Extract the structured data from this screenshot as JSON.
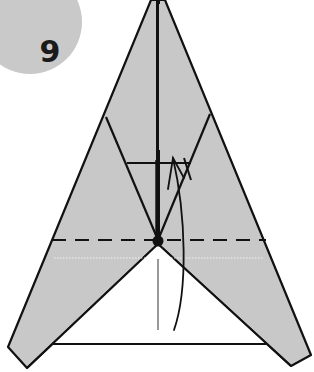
{
  "step": {
    "number": "9"
  },
  "colors": {
    "paper_fill": "#c8c8c8",
    "line": "#111111",
    "badge": "#c9c9c9",
    "background": "#ffffff"
  },
  "diagram": {
    "fold_line": "valley-fold (dashed)",
    "pivot": "center dot",
    "arrow": "curved fold arrow from bottom up to crease"
  }
}
